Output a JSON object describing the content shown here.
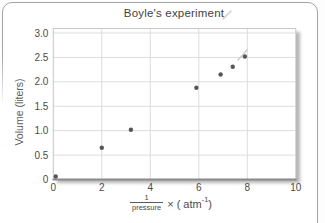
{
  "chart_data": {
    "type": "scatter",
    "title": "Boyle's experiment",
    "ylabel": "Volume (liters)",
    "xlabel_fraction": {
      "numerator": "1",
      "denominator": "pressure"
    },
    "xlabel_rest": {
      "pre": "× ( atm",
      "exponent": "-1",
      "post": ")"
    },
    "xlim": [
      0,
      10
    ],
    "ylim": [
      0,
      3
    ],
    "x_ticks": [
      0,
      2,
      4,
      6,
      8,
      10
    ],
    "y_ticks": [
      0,
      0.5,
      1,
      1.5,
      2,
      2.5,
      3
    ],
    "x_tick_labels": [
      "0",
      "2",
      "4",
      "6",
      "8",
      "10"
    ],
    "y_tick_labels": [
      "0",
      "0.5",
      "1.0",
      "1.5",
      "2.0",
      "2.5",
      "3.0"
    ],
    "grid": true,
    "legend": "none",
    "points": [
      {
        "x": 0.1,
        "y": 0.06
      },
      {
        "x": 2.0,
        "y": 0.65
      },
      {
        "x": 3.2,
        "y": 1.02
      },
      {
        "x": 5.9,
        "y": 1.88
      },
      {
        "x": 6.9,
        "y": 2.15
      },
      {
        "x": 7.4,
        "y": 2.31
      },
      {
        "x": 7.9,
        "y": 2.52
      }
    ],
    "stray_marks": [
      {
        "x1": 223,
        "y1": 19,
        "x2": 231,
        "y2": 11
      },
      {
        "x1": 238,
        "y1": 60,
        "x2": 247,
        "y2": 50
      }
    ],
    "colors": {
      "point": "#575757",
      "grid": "#dcdcdc",
      "axis": "#8a8a8a",
      "box_border": "#c6c6c6",
      "text": "#4a4a4a",
      "card_border": "#a3a3a3",
      "stray_mark": "#c9c9c9"
    }
  }
}
